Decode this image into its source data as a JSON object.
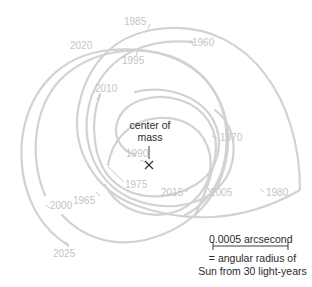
{
  "diagram": {
    "center_label_line1": "center of",
    "center_label_line2": "mass",
    "center_marker": "×",
    "path_color": "#d2d2d2",
    "label_color": "#c4c4c4",
    "text_color": "#2a2a2a",
    "year_labels": [
      {
        "year": "1985",
        "x": 124,
        "y": 17
      },
      {
        "year": "1960",
        "x": 192,
        "y": 38
      },
      {
        "year": "2020",
        "x": 70,
        "y": 41
      },
      {
        "year": "1995",
        "x": 122,
        "y": 56
      },
      {
        "year": "2010",
        "x": 95,
        "y": 84
      },
      {
        "year": "1970",
        "x": 220,
        "y": 133
      },
      {
        "year": "1990",
        "x": 126,
        "y": 149
      },
      {
        "year": "1975",
        "x": 125,
        "y": 180
      },
      {
        "year": "2015",
        "x": 161,
        "y": 188
      },
      {
        "year": "2005",
        "x": 210,
        "y": 188
      },
      {
        "year": "1980",
        "x": 266,
        "y": 188
      },
      {
        "year": "1965",
        "x": 73,
        "y": 196
      },
      {
        "year": "2000",
        "x": 50,
        "y": 201
      },
      {
        "year": "2025",
        "x": 53,
        "y": 249
      }
    ]
  },
  "scale_bar": {
    "value_label": "0.0005 arcsecond",
    "caption_line1": "= angular radius of",
    "caption_line2": "Sun from 30 light-years"
  }
}
